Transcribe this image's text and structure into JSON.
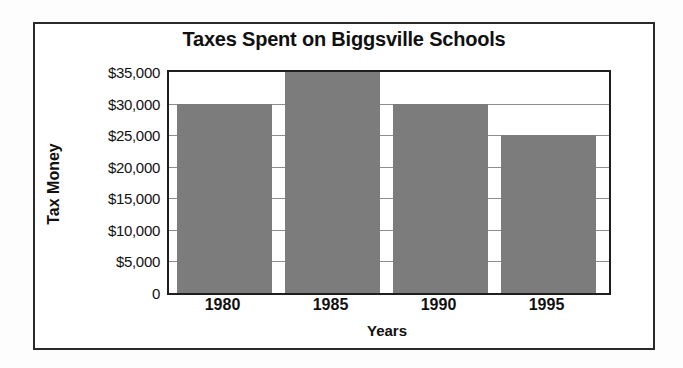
{
  "chart_data": {
    "type": "bar",
    "title": "Taxes Spent on Biggsville Schools",
    "xlabel": "Years",
    "ylabel": "Tax Money",
    "categories": [
      "1980",
      "1985",
      "1990",
      "1995"
    ],
    "values": [
      30000,
      35000,
      30000,
      25000
    ],
    "ylim": [
      0,
      35000
    ],
    "ytick_values": [
      0,
      5000,
      10000,
      15000,
      20000,
      25000,
      30000,
      35000
    ],
    "ytick_labels": [
      "0",
      "$5,000",
      "$10,000",
      "$15,000",
      "$20,000",
      "$25,000",
      "$30,000",
      "$35,000"
    ],
    "grid": true,
    "legend": false,
    "bar_color": "#7c7c7c",
    "axis_color": "#1e1e1e",
    "gridline_color": "#8d8d8d",
    "frame_color": "#2a2a2a",
    "background": "#ffffff"
  }
}
